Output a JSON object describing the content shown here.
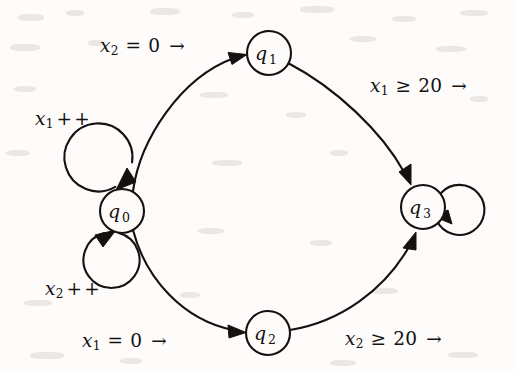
{
  "diagram": {
    "type": "state-machine",
    "background_color": "#fdfcfb",
    "stroke_color": "#141110",
    "states": [
      {
        "id": "q0",
        "label": "q",
        "sub": "0",
        "cx": 122,
        "cy": 211,
        "r": 22
      },
      {
        "id": "q1",
        "label": "q",
        "sub": "1",
        "cx": 269,
        "cy": 53,
        "r": 22
      },
      {
        "id": "q2",
        "label": "q",
        "sub": "2",
        "cx": 268,
        "cy": 333,
        "r": 22
      },
      {
        "id": "q3",
        "label": "q",
        "sub": "3",
        "cx": 423,
        "cy": 207,
        "r": 22
      }
    ],
    "transitions": [
      {
        "id": "t-q0-q0-x1",
        "from": "q0",
        "to": "q0",
        "kind": "self-loop",
        "label_html": "<i>x</i><sub>1</sub><span class=\"op\">&#8202;+&#8202;+</span>",
        "label_text": "x1 ++",
        "label_x": 35,
        "label_y": 110
      },
      {
        "id": "t-q0-q0-x2",
        "from": "q0",
        "to": "q0",
        "kind": "self-loop",
        "label_html": "<i>x</i><sub>2</sub><span class=\"op\">&#8202;+&#8202;+</span>",
        "label_text": "x2 ++",
        "label_x": 45,
        "label_y": 280
      },
      {
        "id": "t-q0-q1",
        "from": "q0",
        "to": "q1",
        "kind": "curve",
        "label_html": "<i>x</i><sub>2</sub> <span class=\"op\">=</span> 0 <span class=\"arw\">&#8594;</span>",
        "label_text": "x2 = 0 →",
        "label_x": 100,
        "label_y": 37
      },
      {
        "id": "t-q1-q3",
        "from": "q1",
        "to": "q3",
        "kind": "curve",
        "label_html": "<i>x</i><sub>1</sub> <span class=\"op\">&#8805;</span> 20 <span class=\"arw\">&#8594;</span>",
        "label_text": "x1 ≥ 20 →",
        "label_x": 370,
        "label_y": 77
      },
      {
        "id": "t-q0-q2",
        "from": "q0",
        "to": "q2",
        "kind": "curve",
        "label_html": "<i>x</i><sub>1</sub> <span class=\"op\">=</span> 0 <span class=\"arw\">&#8594;</span>",
        "label_text": "x1 = 0 →",
        "label_x": 82,
        "label_y": 332
      },
      {
        "id": "t-q2-q3",
        "from": "q2",
        "to": "q3",
        "kind": "curve",
        "label_html": "<i>x</i><sub>2</sub> <span class=\"op\">&#8805;</span> 20 <span class=\"arw\">&#8594;</span>",
        "label_text": "x2 ≥ 20 →",
        "label_x": 345,
        "label_y": 330
      },
      {
        "id": "t-q3-q3",
        "from": "q3",
        "to": "q3",
        "kind": "self-loop",
        "label_html": "",
        "label_text": "",
        "label_x": 0,
        "label_y": 0
      }
    ]
  }
}
